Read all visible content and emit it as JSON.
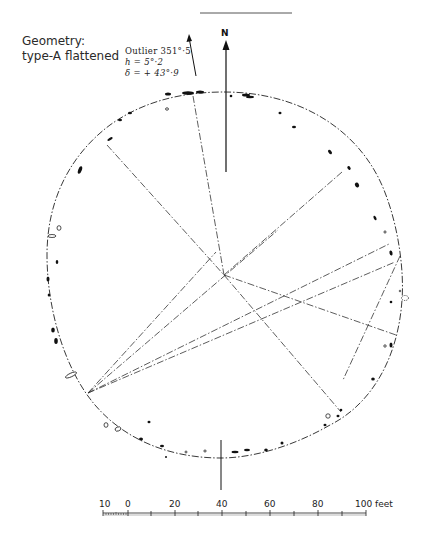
{
  "title": {
    "line1": "Geometry:",
    "line2": "type-A flattened"
  },
  "outlier": {
    "label": "Outlier 351°·5",
    "h": "h = 5°·2",
    "delta": "δ = + 43°·9"
  },
  "north_label": "N",
  "scale_bar": {
    "labels": [
      "10",
      "0",
      "20",
      "40",
      "60",
      "80",
      "100 feet"
    ],
    "unit": "feet",
    "min": -10,
    "max": 100
  },
  "colors": {
    "ink": "#1a1a1a",
    "background": "#ffffff"
  }
}
